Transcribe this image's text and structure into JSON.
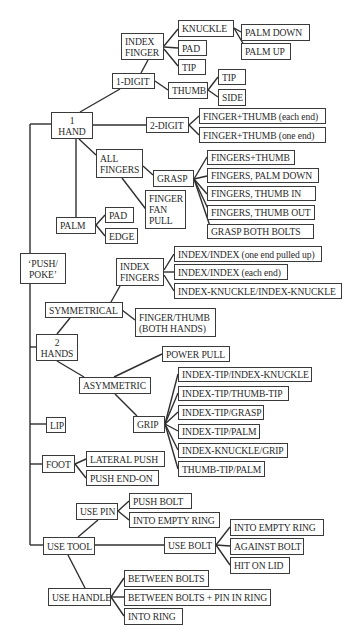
{
  "diagram": {
    "line_color": "#2f2f2f",
    "box_border_color": "#3a3a3a",
    "text_color": "#2a2a2a",
    "nodes": [
      {
        "id": "push_poke",
        "label": "‘PUSH/\nPOKE’",
        "x": 20,
        "y": 253,
        "w": 46,
        "h": 31,
        "center": true
      },
      {
        "id": "one_hand",
        "label": "1\nHAND",
        "x": 51,
        "y": 112,
        "w": 42,
        "h": 27,
        "center": true
      },
      {
        "id": "one_digit",
        "label": "1-DIGIT",
        "x": 112,
        "y": 73,
        "w": 43,
        "h": 16
      },
      {
        "id": "index_finger",
        "label": "INDEX\nFINGER",
        "x": 121,
        "y": 33,
        "w": 43,
        "h": 27
      },
      {
        "id": "if_knuckle",
        "label": "KNUCKLE",
        "x": 178,
        "y": 20,
        "w": 56,
        "h": 17
      },
      {
        "id": "palm_down",
        "label": "PALM DOWN",
        "x": 241,
        "y": 24,
        "w": 69,
        "h": 17
      },
      {
        "id": "palm_up",
        "label": "PALM UP",
        "x": 241,
        "y": 43,
        "w": 50,
        "h": 17
      },
      {
        "id": "if_pad",
        "label": "PAD",
        "x": 178,
        "y": 40,
        "w": 29,
        "h": 16
      },
      {
        "id": "if_tip",
        "label": "TIP",
        "x": 178,
        "y": 59,
        "w": 28,
        "h": 16
      },
      {
        "id": "thumb",
        "label": "THUMB",
        "x": 168,
        "y": 82,
        "w": 40,
        "h": 17
      },
      {
        "id": "thumb_tip",
        "label": "TIP",
        "x": 218,
        "y": 69,
        "w": 28,
        "h": 16
      },
      {
        "id": "thumb_side",
        "label": "SIDE",
        "x": 218,
        "y": 89,
        "w": 28,
        "h": 17
      },
      {
        "id": "two_digit",
        "label": "2-DIGIT",
        "x": 146,
        "y": 117,
        "w": 43,
        "h": 16
      },
      {
        "id": "ft_each_end",
        "label": "FINGER+THUMB (each end)",
        "x": 199,
        "y": 108,
        "w": 127,
        "h": 16
      },
      {
        "id": "ft_one_end",
        "label": "FINGER+THUMB (one end)",
        "x": 199,
        "y": 127,
        "w": 127,
        "h": 16
      },
      {
        "id": "all_fingers",
        "label": "ALL\nFINGERS",
        "x": 96,
        "y": 149,
        "w": 47,
        "h": 29
      },
      {
        "id": "grasp",
        "label": "GRASP",
        "x": 153,
        "y": 170,
        "w": 41,
        "h": 17
      },
      {
        "id": "g_fingers_thumb",
        "label": "FINGERS+THUMB",
        "x": 207,
        "y": 150,
        "w": 88,
        "h": 15
      },
      {
        "id": "g_palm_down",
        "label": "FINGERS, PALM DOWN",
        "x": 207,
        "y": 168,
        "w": 112,
        "h": 15
      },
      {
        "id": "g_thumb_in",
        "label": "FINGERS, THUMB IN",
        "x": 207,
        "y": 186,
        "w": 109,
        "h": 15
      },
      {
        "id": "g_thumb_out",
        "label": "FINGERS, THUMB OUT",
        "x": 207,
        "y": 205,
        "w": 108,
        "h": 15
      },
      {
        "id": "g_both_bolts",
        "label": "GRASP BOTH BOLTS",
        "x": 207,
        "y": 224,
        "w": 107,
        "h": 15
      },
      {
        "id": "finger_fan_pull",
        "label": "FINGER\nFAN\nPULL",
        "x": 145,
        "y": 190,
        "w": 41,
        "h": 39
      },
      {
        "id": "palm",
        "label": "PALM",
        "x": 56,
        "y": 217,
        "w": 40,
        "h": 17
      },
      {
        "id": "palm_pad",
        "label": "PAD",
        "x": 105,
        "y": 207,
        "w": 29,
        "h": 16
      },
      {
        "id": "palm_edge",
        "label": "EDGE",
        "x": 105,
        "y": 228,
        "w": 33,
        "h": 16
      },
      {
        "id": "two_hands",
        "label": "2\nHANDS",
        "x": 36,
        "y": 334,
        "w": 42,
        "h": 27,
        "center": true
      },
      {
        "id": "symmetrical",
        "label": "SYMMETRICAL",
        "x": 45,
        "y": 302,
        "w": 78,
        "h": 16
      },
      {
        "id": "index_fingers",
        "label": "INDEX\nFINGERS",
        "x": 116,
        "y": 258,
        "w": 48,
        "h": 28
      },
      {
        "id": "ii_pulled_up",
        "label": "INDEX/INDEX (one end pulled up)",
        "x": 174,
        "y": 246,
        "w": 148,
        "h": 16
      },
      {
        "id": "ii_each_end",
        "label": "INDEX/INDEX (each end)",
        "x": 174,
        "y": 264,
        "w": 114,
        "h": 16
      },
      {
        "id": "ik_ik",
        "label": "INDEX-KNUCKLE/INDEX-KNUCKLE",
        "x": 174,
        "y": 283,
        "w": 168,
        "h": 16
      },
      {
        "id": "finger_thumb_both",
        "label": "FINGER/THUMB\n(BOTH HANDS)",
        "x": 135,
        "y": 308,
        "w": 81,
        "h": 29
      },
      {
        "id": "asymmetric",
        "label": "ASYMMETRIC",
        "x": 79,
        "y": 377,
        "w": 72,
        "h": 17
      },
      {
        "id": "power_pull",
        "label": "POWER PULL",
        "x": 162,
        "y": 346,
        "w": 68,
        "h": 16
      },
      {
        "id": "grip",
        "label": "GRIP",
        "x": 133,
        "y": 416,
        "w": 32,
        "h": 17
      },
      {
        "id": "it_ik",
        "label": "INDEX-TIP/INDEX-KNUCKLE",
        "x": 178,
        "y": 367,
        "w": 134,
        "h": 15
      },
      {
        "id": "it_tt",
        "label": "INDEX-TIP/THUMB-TIP",
        "x": 178,
        "y": 386,
        "w": 111,
        "h": 15
      },
      {
        "id": "it_grasp",
        "label": "INDEX-TIP/GRASP",
        "x": 178,
        "y": 405,
        "w": 86,
        "h": 15
      },
      {
        "id": "it_palm",
        "label": "INDEX-TIP/PALM",
        "x": 178,
        "y": 424,
        "w": 82,
        "h": 15
      },
      {
        "id": "ik_grip",
        "label": "INDEX-KNUCKLE/GRIP",
        "x": 178,
        "y": 443,
        "w": 110,
        "h": 15
      },
      {
        "id": "tt_palm",
        "label": "THUMB-TIP/PALM",
        "x": 178,
        "y": 461,
        "w": 87,
        "h": 16
      },
      {
        "id": "lip",
        "label": "LIP",
        "x": 46,
        "y": 417,
        "w": 20,
        "h": 16
      },
      {
        "id": "foot",
        "label": "FOOT",
        "x": 42,
        "y": 455,
        "w": 33,
        "h": 18
      },
      {
        "id": "lateral_push",
        "label": "LATERAL PUSH",
        "x": 86,
        "y": 451,
        "w": 79,
        "h": 16
      },
      {
        "id": "push_end_on",
        "label": "PUSH END-ON",
        "x": 86,
        "y": 470,
        "w": 73,
        "h": 16
      },
      {
        "id": "use_tool",
        "label": "USE TOOL",
        "x": 43,
        "y": 537,
        "w": 52,
        "h": 18
      },
      {
        "id": "use_pin",
        "label": "USE PIN",
        "x": 76,
        "y": 503,
        "w": 42,
        "h": 17
      },
      {
        "id": "pin_push_bolt",
        "label": "PUSH BOLT",
        "x": 129,
        "y": 493,
        "w": 63,
        "h": 16
      },
      {
        "id": "pin_into_empty_ring",
        "label": "INTO EMPTY RING",
        "x": 129,
        "y": 512,
        "w": 91,
        "h": 16
      },
      {
        "id": "use_bolt",
        "label": "USE BOLT",
        "x": 164,
        "y": 537,
        "w": 52,
        "h": 17
      },
      {
        "id": "bolt_into_empty_ring",
        "label": "INTO EMPTY RING",
        "x": 230,
        "y": 519,
        "w": 94,
        "h": 17
      },
      {
        "id": "bolt_against_bolt",
        "label": "AGAINST BOLT",
        "x": 230,
        "y": 538,
        "w": 74,
        "h": 17
      },
      {
        "id": "bolt_hit_on_lid",
        "label": "HIT ON LID",
        "x": 230,
        "y": 557,
        "w": 60,
        "h": 17
      },
      {
        "id": "use_handle",
        "label": "USE HANDLE",
        "x": 48,
        "y": 588,
        "w": 63,
        "h": 18
      },
      {
        "id": "h_between_bolts",
        "label": "BETWEEN BOLTS",
        "x": 124,
        "y": 570,
        "w": 85,
        "h": 17
      },
      {
        "id": "h_between_bolts_pin",
        "label": "BETWEEN BOLTS + PIN IN RING",
        "x": 124,
        "y": 589,
        "w": 147,
        "h": 17
      },
      {
        "id": "h_into_ring",
        "label": "INTO RING",
        "x": 124,
        "y": 608,
        "w": 59,
        "h": 17
      }
    ],
    "edges": [
      [
        30,
        124,
        51,
        124
      ],
      [
        30,
        124,
        30,
        545
      ],
      [
        30,
        545,
        43,
        545
      ],
      [
        30,
        347,
        36,
        347
      ],
      [
        30,
        424,
        46,
        424
      ],
      [
        30,
        464,
        42,
        464
      ],
      [
        80,
        112,
        120,
        89
      ],
      [
        141,
        73,
        148,
        60
      ],
      [
        164,
        46,
        178,
        29
      ],
      [
        164,
        47,
        178,
        48
      ],
      [
        164,
        49,
        178,
        66
      ],
      [
        234,
        28,
        241,
        32
      ],
      [
        234,
        28,
        248,
        52
      ],
      [
        155,
        81,
        168,
        90
      ],
      [
        208,
        90,
        218,
        77
      ],
      [
        208,
        90,
        218,
        97
      ],
      [
        93,
        125,
        146,
        125
      ],
      [
        189,
        125,
        199,
        116
      ],
      [
        189,
        125,
        199,
        135
      ],
      [
        79,
        139,
        96,
        155
      ],
      [
        143,
        166,
        153,
        175
      ],
      [
        194,
        179,
        207,
        157
      ],
      [
        194,
        179,
        207,
        176
      ],
      [
        194,
        179,
        207,
        194
      ],
      [
        194,
        179,
        210,
        213
      ],
      [
        194,
        179,
        212,
        232
      ],
      [
        122,
        178,
        148,
        212
      ],
      [
        76,
        139,
        76,
        217
      ],
      [
        96,
        225,
        105,
        215
      ],
      [
        96,
        225,
        105,
        236
      ],
      [
        57,
        334,
        70,
        318
      ],
      [
        122,
        310,
        135,
        320
      ],
      [
        111,
        302,
        120,
        286
      ],
      [
        164,
        270,
        174,
        254
      ],
      [
        164,
        272,
        174,
        272
      ],
      [
        164,
        275,
        174,
        291
      ],
      [
        57,
        361,
        84,
        377
      ],
      [
        114,
        377,
        162,
        354
      ],
      [
        115,
        394,
        137,
        416
      ],
      [
        165,
        424,
        178,
        374
      ],
      [
        165,
        424,
        178,
        393
      ],
      [
        165,
        424,
        178,
        412
      ],
      [
        165,
        424,
        178,
        431
      ],
      [
        165,
        424,
        178,
        450
      ],
      [
        165,
        424,
        178,
        469
      ],
      [
        75,
        464,
        86,
        459
      ],
      [
        75,
        464,
        86,
        478
      ],
      [
        78,
        537,
        98,
        520
      ],
      [
        118,
        511,
        129,
        501
      ],
      [
        118,
        511,
        129,
        520
      ],
      [
        95,
        545,
        164,
        545
      ],
      [
        216,
        545,
        230,
        527
      ],
      [
        216,
        545,
        230,
        546
      ],
      [
        216,
        545,
        230,
        565
      ],
      [
        68,
        555,
        85,
        588
      ],
      [
        111,
        597,
        124,
        578
      ],
      [
        111,
        597,
        124,
        597
      ],
      [
        111,
        597,
        124,
        616
      ]
    ]
  }
}
